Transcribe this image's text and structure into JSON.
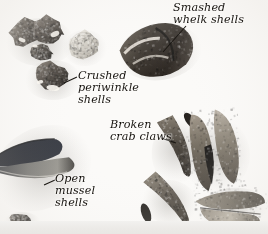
{
  "figure": {
    "kind": "photograph",
    "medium": "monochrome-photograph",
    "background_color": "#fbfaf8",
    "label_text_color": "#16130f",
    "leader_line_color": "#1a1713",
    "bottom_band_color": "#eceae7"
  },
  "labels": [
    {
      "id": "crushed-periwinkle-shells",
      "text": "Crushed\nperiwinkle\nshells",
      "lines": [
        "Crushed",
        "periwinkle",
        "shells"
      ],
      "x": 78,
      "y": 70
    },
    {
      "id": "smashed-whelk-shells",
      "text": "Smashed\nwhelk shells",
      "lines": [
        "Smashed",
        "whelk shells"
      ],
      "x": 173,
      "y": 2
    },
    {
      "id": "broken-crab-claws",
      "text": "Broken\ncrab claws",
      "lines": [
        "Broken",
        "crab claws"
      ],
      "x": 110,
      "y": 119
    },
    {
      "id": "open-mussel-shells",
      "text": "Open\nmussel\nshells",
      "lines": [
        "Open",
        "mussel",
        "shells"
      ],
      "x": 55,
      "y": 173
    }
  ],
  "specimens": [
    {
      "id": "periwinkle-cluster-upper",
      "description": "Cluster of dark crushed periwinkle shells",
      "tone": "#4a443d"
    },
    {
      "id": "periwinkle-pale",
      "description": "Pale crushed periwinkle shell",
      "tone": "#d8d4cc"
    },
    {
      "id": "periwinkle-lower",
      "description": "Dark crushed periwinkle shell",
      "tone": "#433d36"
    },
    {
      "id": "whelk-shell",
      "description": "Smashed whelk shell showing broken spire",
      "tone": "#3b3630"
    },
    {
      "id": "mussel-shell",
      "description": "Open blue mussel shell valves",
      "tone": "#15161c"
    },
    {
      "id": "crab-claw-curved-upper",
      "description": "Broken curved crab claw",
      "tone": "#5d564d"
    },
    {
      "id": "crab-claw-curved-lower",
      "description": "Broken curved crab claw",
      "tone": "#554e46"
    },
    {
      "id": "crab-claw-pincer",
      "description": "Crab pincer claw with dark tips",
      "tone": "#6a6257"
    },
    {
      "id": "crab-claw-segment",
      "description": "Crab claw segment",
      "tone": "#7a7267"
    },
    {
      "id": "crab-claw-flat",
      "description": "Flat broken crab claw",
      "tone": "#6f6a60"
    }
  ]
}
